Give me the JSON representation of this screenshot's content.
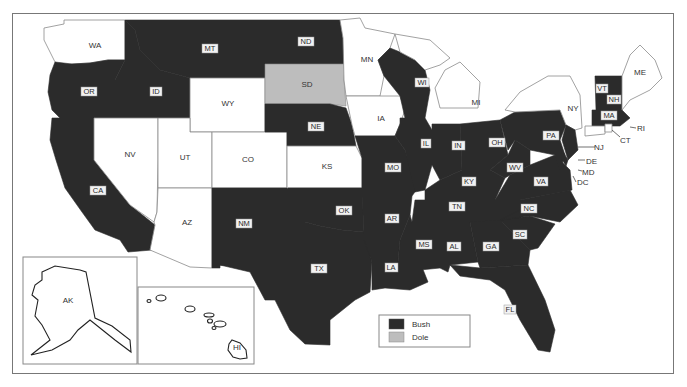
{
  "map": {
    "legend": [
      {
        "label": "Bush",
        "color": "#2b2b2b"
      },
      {
        "label": "Dole",
        "color": "#bdbdbd"
      }
    ],
    "colors": {
      "bush": "#2b2b2b",
      "dole": "#bdbdbd",
      "other": "#ffffff"
    },
    "states": {
      "WA": "WA",
      "OR": "OR",
      "CA": "CA",
      "ID": "ID",
      "NV": "NV",
      "MT": "MT",
      "WY": "WY",
      "UT": "UT",
      "AZ": "AZ",
      "CO": "CO",
      "NM": "NM",
      "ND": "ND",
      "SD": "SD",
      "NE": "NE",
      "KS": "KS",
      "OK": "OK",
      "TX": "TX",
      "MN": "MN",
      "IA": "IA",
      "MO": "MO",
      "AR": "AR",
      "LA": "LA",
      "WI": "WI",
      "IL": "IL",
      "MI": "MI",
      "IN": "IN",
      "OH": "OH",
      "KY": "KY",
      "TN": "TN",
      "MS": "MS",
      "AL": "AL",
      "GA": "GA",
      "FL": "FL",
      "SC": "SC",
      "NC": "NC",
      "VA": "VA",
      "WV": "WV",
      "PA": "PA",
      "NY": "NY",
      "VT": "VT",
      "NH": "NH",
      "ME": "ME",
      "MA": "MA",
      "RI": "RI",
      "CT": "CT",
      "NJ": "NJ",
      "DE": "DE",
      "MD": "MD",
      "DC": "DC",
      "AK": "AK",
      "HI": "HI"
    },
    "winners": {
      "Bush": [
        "OR",
        "CA",
        "ID",
        "MT",
        "ND",
        "NE",
        "NM",
        "OK",
        "TX",
        "WI",
        "IL",
        "IN",
        "OH",
        "MO",
        "AR",
        "LA",
        "MS",
        "AL",
        "GA",
        "FL",
        "SC",
        "NC",
        "VA",
        "WV",
        "KY",
        "TN",
        "PA",
        "NJ",
        "DE",
        "MD",
        "VT",
        "NH",
        "MA"
      ],
      "Dole": [
        "SD"
      ],
      "Other": [
        "WA",
        "NV",
        "UT",
        "AZ",
        "WY",
        "CO",
        "KS",
        "MN",
        "IA",
        "MI",
        "NY",
        "ME",
        "RI",
        "CT",
        "DC",
        "AK",
        "HI"
      ]
    }
  }
}
